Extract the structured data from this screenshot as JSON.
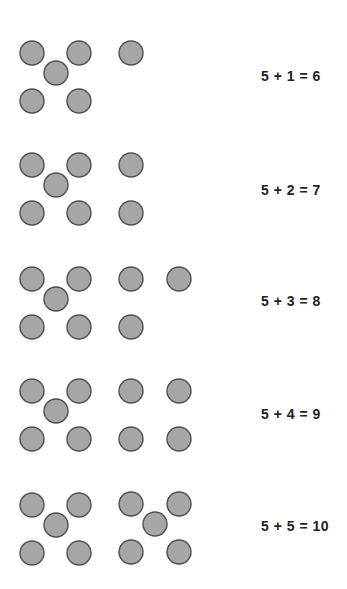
{
  "rows": [
    {
      "base": 5,
      "added": 1,
      "total": 6,
      "equation": "5 + 1 = 6"
    },
    {
      "base": 5,
      "added": 2,
      "total": 7,
      "equation": "5 + 2 = 7"
    },
    {
      "base": 5,
      "added": 3,
      "total": 8,
      "equation": "5 + 3 = 8"
    },
    {
      "base": 5,
      "added": 4,
      "total": 9,
      "equation": "5 + 4 = 9"
    },
    {
      "base": 5,
      "added": 5,
      "total": 10,
      "equation": "5 + 5 = 10"
    }
  ],
  "colors": {
    "dot_fill": "#a6a6a6",
    "dot_stroke": "#505050",
    "text": "#222222"
  }
}
